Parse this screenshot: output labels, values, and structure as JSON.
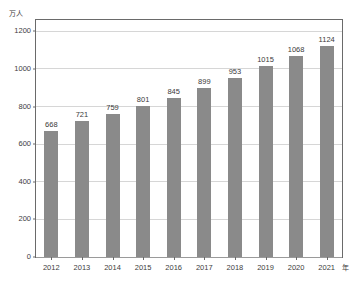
{
  "chart_data": {
    "type": "bar",
    "title": "",
    "subtitle": "",
    "categories": [
      "2012",
      "2013",
      "2014",
      "2015",
      "2016",
      "2017",
      "2018",
      "2019",
      "2020",
      "2021"
    ],
    "values": [
      668,
      721,
      759,
      801,
      845,
      899,
      953,
      1015,
      1068,
      1124
    ],
    "series": [
      {
        "name": "",
        "values": [
          668,
          721,
          759,
          801,
          845,
          899,
          953,
          1015,
          1068,
          1124
        ]
      }
    ],
    "data_labels": [
      "668",
      "721",
      "759",
      "801",
      "845",
      "899",
      "953",
      "1015",
      "1068",
      "1124"
    ],
    "xlabel": "",
    "ylabel": "",
    "y_unit_label": "万人",
    "x_unit_label": "年",
    "ytick_labels": [
      "0",
      "200",
      "400",
      "600",
      "800",
      "1000",
      "1200"
    ],
    "yticks": [
      0,
      200,
      400,
      600,
      800,
      1000,
      1200
    ],
    "ylim": [
      0,
      1260
    ],
    "xtick_labels": [
      "2012",
      "2013",
      "2014",
      "2015",
      "2016",
      "2017",
      "2018",
      "2019",
      "2020",
      "2021"
    ],
    "grid": true,
    "grid_axis": "y",
    "legend": false,
    "legend_position": "none",
    "bar_color": "#8a8a8a",
    "grid_color": "#d6d6d6",
    "frame_color": "#6a6a6a",
    "text_color": "#3a3a3a",
    "background_color": "#ffffff"
  }
}
